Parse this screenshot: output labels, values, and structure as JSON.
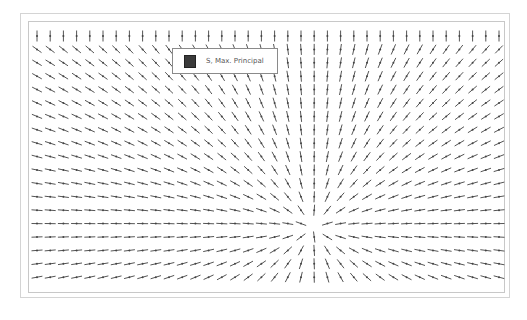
{
  "plot": {
    "title": "Max. principal stress direction field",
    "legend": {
      "label": "S, Max. Principal",
      "swatch_color": "#3a3a3a"
    },
    "colors": {
      "vector": "#555555",
      "frame": "#c8c8c8",
      "background": "#ffffff"
    },
    "field": {
      "singularity": {
        "x": 313,
        "y": 228
      },
      "grid": {
        "x_start": 37,
        "x_step": 13.2,
        "cols": 36,
        "y_start": 36,
        "y_step": 13.4,
        "rows": 20
      },
      "segment_length": 11
    }
  }
}
